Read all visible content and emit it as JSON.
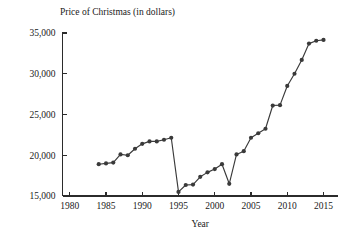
{
  "chart_data": {
    "type": "line",
    "title": "Price of Christmas (in dollars)",
    "xlabel": "Year",
    "ylabel": "",
    "xlim": [
      1979,
      2017
    ],
    "ylim": [
      15000,
      35000
    ],
    "xticks": [
      "1980",
      "1985",
      "1990",
      "1995",
      "2000",
      "2005",
      "2010",
      "2015"
    ],
    "xtick_values": [
      1980,
      1985,
      1990,
      1995,
      2000,
      2005,
      2010,
      2015
    ],
    "yticks": [
      "15,000",
      "20,000",
      "25,000",
      "30,000",
      "35,000"
    ],
    "ytick_values": [
      15000,
      20000,
      25000,
      30000,
      35000
    ],
    "grid": false,
    "legend": "none",
    "marker": "circle",
    "line_color": "#3a3a3a",
    "x": [
      1984,
      1985,
      1986,
      1987,
      1988,
      1989,
      1990,
      1991,
      1992,
      1993,
      1994,
      1995,
      1996,
      1997,
      1998,
      1999,
      2000,
      2001,
      2002,
      2003,
      2004,
      2005,
      2006,
      2007,
      2008,
      2009,
      2010,
      2011,
      2012,
      2013,
      2014,
      2015
    ],
    "values": [
      18900,
      19000,
      19100,
      20100,
      20000,
      20800,
      21400,
      21700,
      21700,
      21900,
      22150,
      15500,
      16350,
      16400,
      17350,
      17900,
      18300,
      18900,
      16500,
      20100,
      20500,
      22150,
      22700,
      23250,
      26100,
      26150,
      28500,
      30000,
      31700,
      33700,
      34050,
      34150
    ]
  }
}
